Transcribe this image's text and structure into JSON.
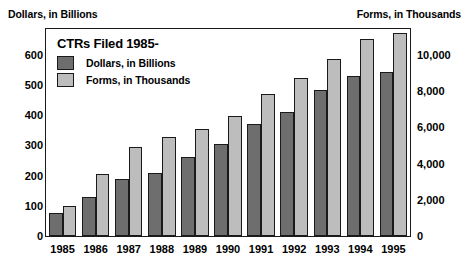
{
  "chart_data": {
    "type": "bar",
    "title": "CTRs Filed 1985-",
    "categories": [
      "1985",
      "1986",
      "1987",
      "1988",
      "1989",
      "1990",
      "1991",
      "1992",
      "1993",
      "1994",
      "1995"
    ],
    "series": [
      {
        "name": "Dollars, in Billions",
        "axis": "left",
        "color": "#6e6e6e",
        "values": [
          75,
          130,
          190,
          208,
          263,
          305,
          370,
          410,
          485,
          530,
          545
        ]
      },
      {
        "name": "Forms, in Thousands",
        "axis": "right",
        "color": "#bdbdbd",
        "values": [
          1650,
          3400,
          4900,
          5450,
          5900,
          6650,
          7850,
          8700,
          9800,
          10900,
          11200
        ]
      }
    ],
    "xlabel": "",
    "ylabel_left": "Dollars, in Billions",
    "ylabel_right": "Forms, in Thousands",
    "ylim_left": [
      0,
      686
    ],
    "ylim_right": [
      0,
      11433
    ],
    "yticks_left": [
      {
        "value": 0,
        "label": "0"
      },
      {
        "value": 100,
        "label": "100"
      },
      {
        "value": 200,
        "label": "200"
      },
      {
        "value": 300,
        "label": "300"
      },
      {
        "value": 400,
        "label": "400"
      },
      {
        "value": 500,
        "label": "500"
      },
      {
        "value": 600,
        "label": "600"
      }
    ],
    "yticks_right": [
      {
        "value": 0,
        "label": "0"
      },
      {
        "value": 2000,
        "label": "2,000"
      },
      {
        "value": 4000,
        "label": "4,000"
      },
      {
        "value": 6000,
        "label": "6,000"
      },
      {
        "value": 8000,
        "label": "8,000"
      },
      {
        "value": 10000,
        "label": "10,000"
      }
    ],
    "grid": false,
    "legend_position": "inside-top-left"
  },
  "captions": {
    "left": "Dollars, in Billions",
    "right": "Forms, in Thousands"
  }
}
